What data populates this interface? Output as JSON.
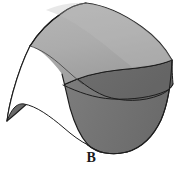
{
  "figure": {
    "caption": "B",
    "alt_label": "curved-surface-diagram",
    "background_color": "#ffffff",
    "outline_color": "#1d1d1d",
    "colors": {
      "top_surface_light": "#b2b2b2",
      "top_surface_mid": "#a6a6a6",
      "underside_dark": "#6e6e6e",
      "front_face_dark": "#767676",
      "left_flap_dark": "#6a6a6a",
      "edge_highlight": "#c9c9c9",
      "caption_text": "#1a1a1a",
      "notch_white": "#ffffff"
    },
    "parts": [
      {
        "name": "top-surface",
        "label": "top draped surface",
        "fill": "#b2b2b2"
      },
      {
        "name": "underside-band",
        "label": "curved underside band",
        "fill": "#6e6e6e"
      },
      {
        "name": "front-right-face",
        "label": "front right face",
        "fill": "#767676"
      },
      {
        "name": "left-flap-face",
        "label": "left hanging flap",
        "fill": "#6a6a6a"
      },
      {
        "name": "notch-wedge",
        "label": "white notch gap",
        "fill": "#ffffff"
      }
    ]
  }
}
